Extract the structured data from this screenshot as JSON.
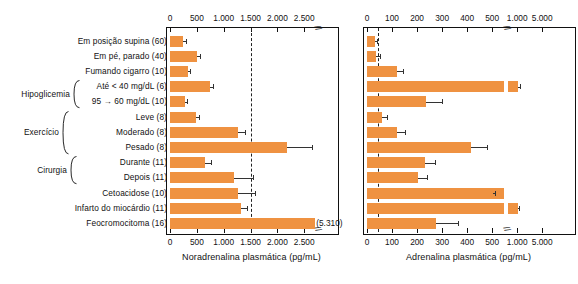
{
  "chart_data": {
    "type": "bar",
    "title": "",
    "orientation": "horizontal",
    "panels": [
      {
        "id": "noradrenalina",
        "xlabel": "Noradrenalina plasmática (pg/mL)",
        "tick_labels": [
          "0",
          "500",
          "1.000",
          "1.500",
          "2.000",
          "2.500"
        ],
        "tick_values": [
          0,
          500,
          1000,
          1500,
          2000,
          2500
        ],
        "axis_break": true,
        "reference_line": 1500,
        "xlim": [
          0,
          2800
        ],
        "values": [
          250,
          500,
          330,
          750,
          275,
          480,
          1270,
          2180,
          660,
          1200,
          1260,
          1320,
          5310
        ],
        "errors_upper": [
          290,
          560,
          370,
          810,
          310,
          540,
          1400,
          2700,
          760,
          1550,
          1580,
          1440,
          5310
        ],
        "data_labels": [
          "",
          "",
          "",
          "",
          "",
          "",
          "",
          "",
          "",
          "",
          "",
          "",
          "(5.310)"
        ]
      },
      {
        "id": "adrenalina",
        "xlabel": "Adrenalina plasmática (pg/mL)",
        "tick_labels": [
          "0",
          "100",
          "200",
          "300",
          "400",
          "500",
          "1.000",
          "5.000"
        ],
        "tick_values": [
          0,
          100,
          200,
          300,
          400,
          500,
          1000,
          5000
        ],
        "axis_break": true,
        "reference_line": 45,
        "xlim": [
          0,
          5000
        ],
        "values": [
          30,
          35,
          120,
          1150,
          235,
          60,
          120,
          415,
          230,
          205,
          515,
          1080,
          275
        ],
        "errors_upper": [
          38,
          50,
          145,
          1400,
          300,
          78,
          150,
          480,
          270,
          240,
          560,
          1250,
          365
        ],
        "data_labels": [
          "",
          "",
          "",
          "",
          "",
          "",
          "",
          "",
          "",
          "",
          "",
          "",
          ""
        ]
      }
    ],
    "categories": [
      "Em posição supina (60)",
      "Em pé, parado (40)",
      "Fumando cigarro (10)",
      "Até < 40 mg/dL (6)",
      "95 → 60 mg/dL (10)",
      "Leve (8)",
      "Moderado (8)",
      "Pesado (8)",
      "Durante (11)",
      "Depois (11)",
      "Cetoacidose (10)",
      "Infarto do miocárdio (11)",
      "Feocromocitoma (16)"
    ],
    "group_labels": [
      {
        "label": "Hipoglicemia",
        "rows": [
          3,
          4
        ]
      },
      {
        "label": "Exercício",
        "rows": [
          5,
          6,
          7
        ]
      },
      {
        "label": "Cirurgia",
        "rows": [
          8,
          9
        ]
      }
    ],
    "colors": {
      "bar": "#ef9241",
      "axis": "#111111",
      "reference_line": "#222222",
      "error_bar": "#333333"
    },
    "grid": false,
    "legend": null
  }
}
